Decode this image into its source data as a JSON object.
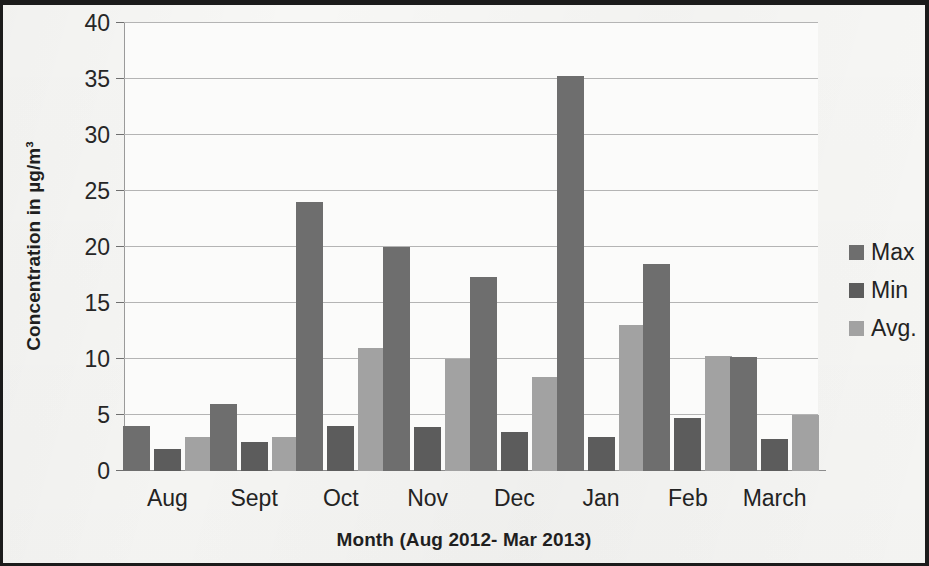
{
  "chart_data": {
    "type": "bar",
    "title": "",
    "xlabel": "Month (Aug 2012- Mar 2013)",
    "ylabel": "Concentration in µg/m³",
    "categories": [
      "Aug",
      "Sept",
      "Oct",
      "Nov",
      "Dec",
      "Jan",
      "Feb",
      "March"
    ],
    "series": [
      {
        "name": "Max",
        "color": "#6e6e6e",
        "values": [
          4.0,
          6.0,
          24.0,
          20.0,
          17.3,
          35.3,
          18.5,
          10.2
        ]
      },
      {
        "name": "Min",
        "color": "#5c5c5c",
        "values": [
          2.0,
          2.6,
          4.0,
          3.9,
          3.5,
          3.0,
          4.7,
          2.9
        ]
      },
      {
        "name": "Avg.",
        "color": "#a2a2a2",
        "values": [
          3.0,
          3.0,
          11.0,
          10.0,
          8.4,
          13.0,
          10.3,
          5.0
        ]
      }
    ],
    "ylim": [
      0,
      40
    ],
    "ytick_step": 5,
    "yticks": [
      0,
      5,
      10,
      15,
      20,
      25,
      30,
      35,
      40
    ],
    "ytick_labels": [
      "0",
      "5",
      "10",
      "15",
      "20",
      "25",
      "30",
      "35",
      "40"
    ],
    "grid": true,
    "grid_axis": "y",
    "legend_position": "right",
    "legend_entries": [
      "Max",
      "Min",
      "Avg."
    ]
  },
  "figure": {
    "border_color": "#1b1b1b",
    "background": "#f7f7f5",
    "plot_background": "#fbfbfa",
    "gridline_color": "#b4b4b4",
    "axis_color": "#8c8c8c",
    "text_color": "#232323"
  }
}
